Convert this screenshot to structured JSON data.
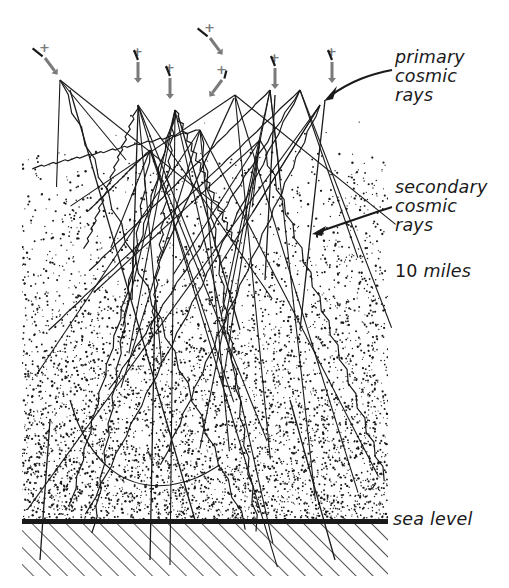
{
  "figure": {
    "colors": {
      "ink": "#1a1a1a",
      "primary_marker": "#7a7a7a",
      "background": "#ffffff"
    }
  },
  "labels": {
    "primary": "primary\ncosmic\nrays",
    "secondary": "secondary\ncosmic\nrays",
    "altitude_value": "10",
    "altitude_unit": "miles",
    "sea_level": "sea level"
  },
  "primary_rays": [
    {
      "x": 45,
      "y": 58,
      "marker": "+",
      "direction": "down-right"
    },
    {
      "x": 138,
      "y": 62,
      "marker": "+",
      "direction": "down"
    },
    {
      "x": 170,
      "y": 78,
      "marker": "+",
      "direction": "down"
    },
    {
      "x": 210,
      "y": 38,
      "marker": "+",
      "direction": "down-right"
    },
    {
      "x": 222,
      "y": 80,
      "marker": "+",
      "direction": "down-left"
    },
    {
      "x": 275,
      "y": 68,
      "marker": "+",
      "direction": "down"
    },
    {
      "x": 332,
      "y": 62,
      "marker": "+",
      "direction": "down"
    }
  ],
  "layout": {
    "sea_level_y": 522,
    "plot_left": 22,
    "plot_right": 388,
    "ground_bottom": 588
  }
}
